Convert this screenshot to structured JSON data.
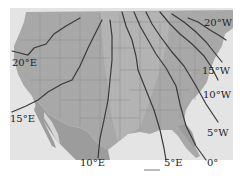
{
  "map": {
    "title": "Magnetic declination isogonic lines over the United States",
    "colors": {
      "ocean": "#e6e6e6",
      "land": "#a9a9a9",
      "land_light": "#c4c4c4",
      "mexico": "#9e9e9e",
      "state_borders": "#8a8a8a",
      "isogonic_line": "#3a3a3a",
      "label": "#222222",
      "page": "#ffffff"
    },
    "isogonic_lines": [
      {
        "id": "20E",
        "label": "20°E"
      },
      {
        "id": "15E",
        "label": "15°E"
      },
      {
        "id": "10E",
        "label": "10°E"
      },
      {
        "id": "5E",
        "label": "5°E"
      },
      {
        "id": "0",
        "label": "0°"
      },
      {
        "id": "5W",
        "label": "5°W"
      },
      {
        "id": "10W",
        "label": "10°W"
      },
      {
        "id": "15W",
        "label": "15°W"
      },
      {
        "id": "20W",
        "label": "20°W"
      }
    ]
  }
}
